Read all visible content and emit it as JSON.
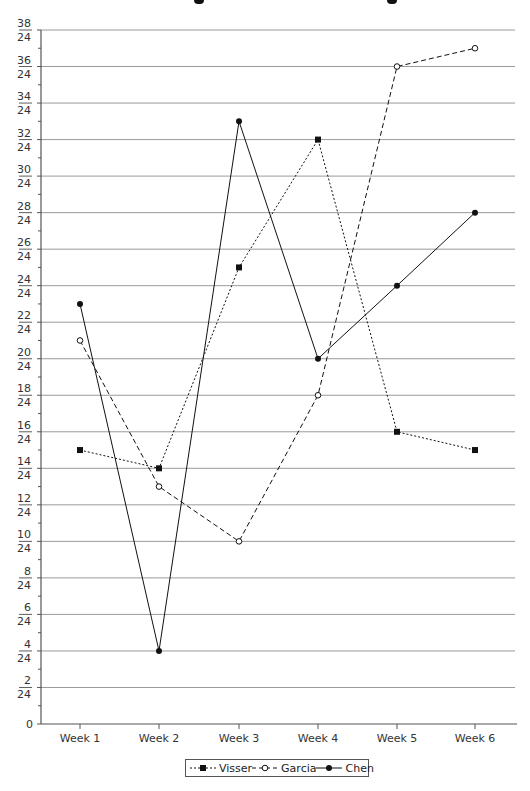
{
  "chart_data": {
    "type": "line",
    "title": "",
    "xlabel": "",
    "ylabel": "",
    "categories": [
      "Week 1",
      "Week 2",
      "Week 3",
      "Week 4",
      "Week 5",
      "Week 6"
    ],
    "series": [
      {
        "name": "Visser",
        "values": [
          15,
          14,
          25,
          32,
          16,
          15
        ],
        "line_style": "dotted",
        "marker": "square-filled"
      },
      {
        "name": "Garcia",
        "values": [
          21,
          13,
          10,
          18,
          36,
          37
        ],
        "line_style": "dashed",
        "marker": "circle-open"
      },
      {
        "name": "Chen",
        "values": [
          23,
          4,
          33,
          20,
          24,
          28
        ],
        "line_style": "solid",
        "marker": "circle-filled"
      }
    ],
    "ylim": [
      0,
      38
    ],
    "yticks": [
      0,
      2,
      4,
      6,
      8,
      10,
      12,
      14,
      16,
      18,
      20,
      22,
      24,
      26,
      28,
      30,
      32,
      34,
      36,
      38
    ],
    "ytick_labels": [
      "0",
      "2/24",
      "4/24",
      "6/24",
      "8/24",
      "10/24",
      "12/24",
      "14/24",
      "16/24",
      "18/24",
      "20/24",
      "22/24",
      "24/24",
      "26/24",
      "28/24",
      "30/24",
      "32/24",
      "34/24",
      "36/24",
      "38/24"
    ],
    "grid": true,
    "legend_position": "bottom",
    "colors": {
      "line": "#111111",
      "grid": "#9a9a9a",
      "axis": "#555555"
    }
  },
  "legend": {
    "items": [
      {
        "label": "Visser"
      },
      {
        "label": "Garcia"
      },
      {
        "label": "Chen"
      }
    ]
  }
}
